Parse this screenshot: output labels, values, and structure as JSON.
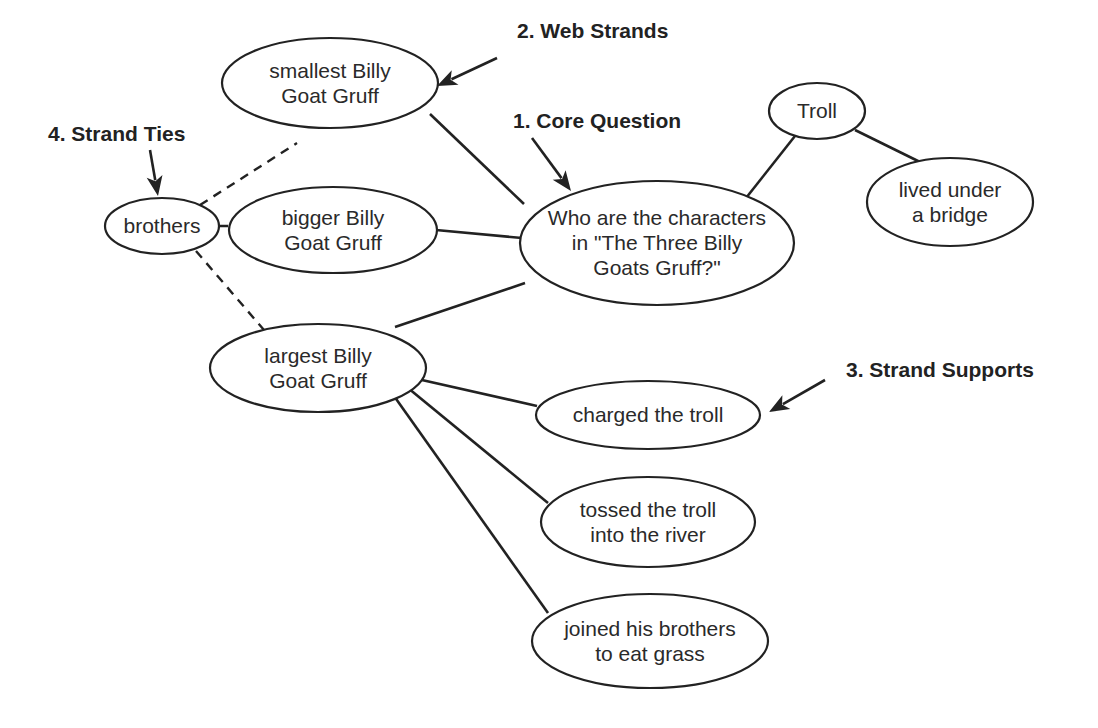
{
  "annotations": [
    {
      "id": "web-strands",
      "label": "2. Web Strands",
      "x": 517,
      "y": 38,
      "arrow": {
        "x1": 497,
        "y1": 58,
        "x2": 437,
        "y2": 86
      }
    },
    {
      "id": "core-question",
      "label": "1. Core Question",
      "x": 513,
      "y": 128,
      "arrow": {
        "x1": 532,
        "y1": 138,
        "x2": 571,
        "y2": 191
      }
    },
    {
      "id": "strand-ties",
      "label": "4. Strand Ties",
      "x": 48,
      "y": 141,
      "arrow": {
        "x1": 150,
        "y1": 150,
        "x2": 158,
        "y2": 196
      }
    },
    {
      "id": "strand-supports",
      "label": "3. Strand Supports",
      "x": 846,
      "y": 377,
      "arrow": {
        "x1": 825,
        "y1": 380,
        "x2": 769,
        "y2": 412
      }
    }
  ],
  "nodes": [
    {
      "id": "core",
      "lines": [
        "Who are the characters",
        "in \"The Three Billy",
        "Goats Gruff?\""
      ],
      "cx": 657,
      "cy": 243,
      "rx": 137,
      "ry": 62
    },
    {
      "id": "smallest",
      "lines": [
        "smallest Billy",
        "Goat Gruff"
      ],
      "cx": 330,
      "cy": 83,
      "rx": 108,
      "ry": 45
    },
    {
      "id": "bigger",
      "lines": [
        "bigger Billy",
        "Goat Gruff"
      ],
      "cx": 333,
      "cy": 230,
      "rx": 104,
      "ry": 43
    },
    {
      "id": "largest",
      "lines": [
        "largest Billy",
        "Goat Gruff"
      ],
      "cx": 318,
      "cy": 368,
      "rx": 108,
      "ry": 44
    },
    {
      "id": "troll",
      "lines": [
        "Troll"
      ],
      "cx": 817,
      "cy": 111,
      "rx": 48,
      "ry": 28
    },
    {
      "id": "bridge",
      "lines": [
        "lived under",
        "a bridge"
      ],
      "cx": 950,
      "cy": 202,
      "rx": 83,
      "ry": 44
    },
    {
      "id": "brothers",
      "lines": [
        "brothers"
      ],
      "cx": 162,
      "cy": 226,
      "rx": 57,
      "ry": 28
    },
    {
      "id": "charged",
      "lines": [
        "charged the troll"
      ],
      "cx": 648,
      "cy": 415,
      "rx": 112,
      "ry": 34
    },
    {
      "id": "tossed",
      "lines": [
        "tossed the troll",
        "into the river"
      ],
      "cx": 648,
      "cy": 522,
      "rx": 107,
      "ry": 45
    },
    {
      "id": "joined",
      "lines": [
        "joined his brothers",
        "to eat grass"
      ],
      "cx": 650,
      "cy": 641,
      "rx": 118,
      "ry": 47
    }
  ],
  "edges": [
    {
      "from": "smallest",
      "to": "core",
      "style": "solid",
      "x1": 430,
      "y1": 114,
      "x2": 524,
      "y2": 204
    },
    {
      "from": "bigger",
      "to": "core",
      "style": "solid",
      "x1": 436,
      "y1": 230,
      "x2": 522,
      "y2": 238
    },
    {
      "from": "largest",
      "to": "core",
      "style": "solid",
      "x1": 395,
      "y1": 327,
      "x2": 525,
      "y2": 283
    },
    {
      "from": "troll",
      "to": "core",
      "style": "solid",
      "x1": 795,
      "y1": 136,
      "x2": 746,
      "y2": 198
    },
    {
      "from": "troll",
      "to": "bridge",
      "style": "solid",
      "x1": 855,
      "y1": 130,
      "x2": 920,
      "y2": 162
    },
    {
      "from": "brothers",
      "to": "smallest",
      "style": "dashed",
      "x1": 200,
      "y1": 205,
      "x2": 297,
      "y2": 143
    },
    {
      "from": "brothers",
      "to": "bigger",
      "style": "dashed",
      "x1": 219,
      "y1": 226,
      "x2": 277,
      "y2": 226
    },
    {
      "from": "brothers",
      "to": "largest",
      "style": "dashed",
      "x1": 196,
      "y1": 251,
      "x2": 264,
      "y2": 330
    },
    {
      "from": "largest",
      "to": "charged",
      "style": "solid",
      "x1": 413,
      "y1": 378,
      "x2": 537,
      "y2": 406
    },
    {
      "from": "largest",
      "to": "tossed",
      "style": "solid",
      "x1": 408,
      "y1": 388,
      "x2": 548,
      "y2": 503
    },
    {
      "from": "largest",
      "to": "joined",
      "style": "solid",
      "x1": 394,
      "y1": 396,
      "x2": 548,
      "y2": 613
    }
  ]
}
